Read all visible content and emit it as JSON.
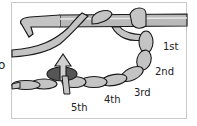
{
  "diagram": {
    "cut_off_left_text": "o",
    "labels": [
      {
        "id": "1st",
        "text": "1st"
      },
      {
        "id": "2nd",
        "text": "2nd"
      },
      {
        "id": "3rd",
        "text": "3rd"
      },
      {
        "id": "4th",
        "text": "4th"
      },
      {
        "id": "5th",
        "text": "5th"
      }
    ],
    "colors": {
      "yarn_fill": "#c4c4c4",
      "yarn_outline": "#1a1a1a",
      "marker_fill": "#555555",
      "hook_fill": "#b9b9b9",
      "frame_border": "#c8c8c8"
    }
  }
}
